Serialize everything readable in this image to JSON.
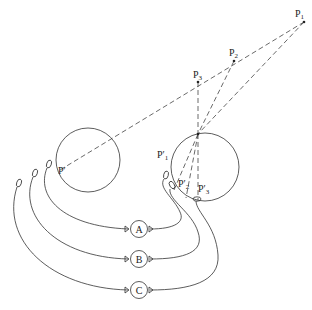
{
  "diagram": {
    "points": {
      "p1": {
        "label": "P",
        "sub": "1"
      },
      "p2": {
        "label": "P",
        "sub": "2"
      },
      "p3": {
        "label": "P",
        "sub": "3"
      },
      "p_prime": {
        "label": "P′"
      },
      "p1_prime": {
        "label": "P′",
        "sub": "1"
      },
      "p2_prime": {
        "label": "P′",
        "sub": "2"
      },
      "p3_prime": {
        "label": "P′",
        "sub": "3"
      }
    },
    "nodes": [
      {
        "label": "A"
      },
      {
        "label": "B"
      },
      {
        "label": "C"
      }
    ],
    "colors": {
      "line": "#333333",
      "background": "#ffffff"
    }
  }
}
